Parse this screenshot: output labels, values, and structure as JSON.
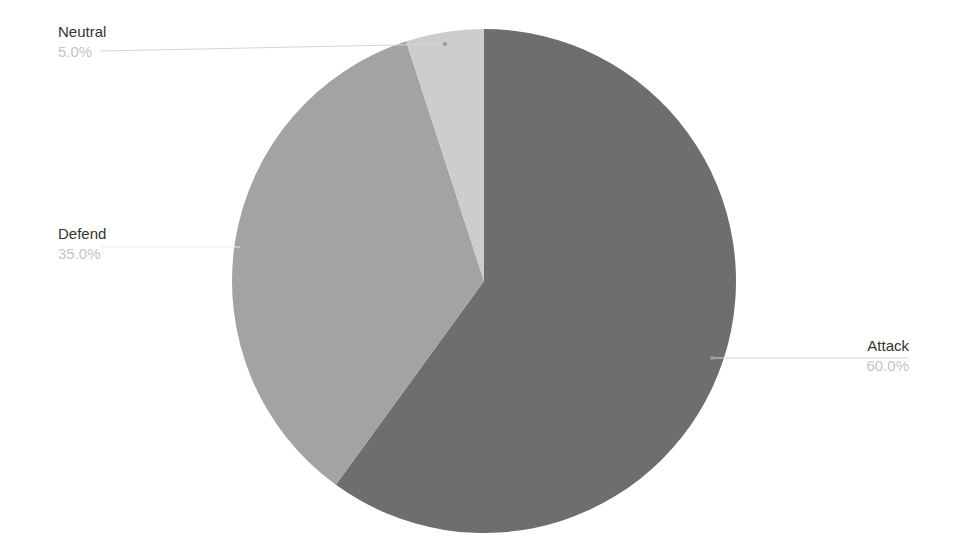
{
  "chart_data": {
    "type": "pie",
    "title": "",
    "start_angle_deg": 0,
    "direction": "clockwise",
    "slices": [
      {
        "label": "Attack",
        "value": 60.0,
        "percent_label": "60.0%",
        "color": "#6e6e6e"
      },
      {
        "label": "Defend",
        "value": 35.0,
        "percent_label": "35.0%",
        "color": "#a3a3a3"
      },
      {
        "label": "Neutral",
        "value": 5.0,
        "percent_label": "5.0%",
        "color": "#cdcdcd"
      }
    ],
    "legend": "none",
    "label_style": "outside-with-leader-lines"
  },
  "labels": {
    "attack": {
      "name": "Attack",
      "pct": "60.0%"
    },
    "defend": {
      "name": "Defend",
      "pct": "35.0%"
    },
    "neutral": {
      "name": "Neutral",
      "pct": "5.0%"
    }
  }
}
